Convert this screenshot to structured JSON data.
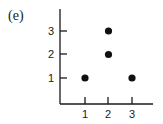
{
  "panel_label": "(e)",
  "chart_data": {
    "type": "scatter",
    "title": "",
    "xlabel": "",
    "ylabel": "",
    "x_ticks": [
      "1",
      "2",
      "3"
    ],
    "y_ticks": [
      "1",
      "2",
      "3"
    ],
    "xlim": [
      0,
      4
    ],
    "ylim": [
      0,
      4
    ],
    "grid": false,
    "legend": null,
    "points": [
      {
        "x": 1,
        "y": 1
      },
      {
        "x": 2,
        "y": 2
      },
      {
        "x": 2,
        "y": 3
      },
      {
        "x": 3,
        "y": 1
      }
    ],
    "marker_color": "#111111"
  }
}
